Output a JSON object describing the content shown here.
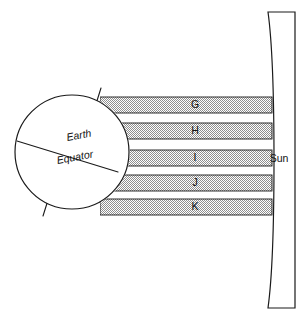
{
  "diagram": {
    "background_color": "#ffffff",
    "line_color": "#1a1a1a",
    "band_fill_color": "#9a9a9a",
    "width": 303,
    "height": 318
  },
  "earth": {
    "label": "Earth",
    "equator_label": "Equator",
    "center_x": 72,
    "center_y": 152,
    "radius": 57,
    "axis_tilt_degrees": 23.5,
    "axis_stub_top": "axis-stub-north",
    "axis_stub_bottom": "axis-stub-south"
  },
  "sun": {
    "label": "Sun",
    "label_x": 279,
    "label_y": 159,
    "left_edge_x": 268,
    "right_edge_x": 295,
    "top_y": 12,
    "bottom_y": 308,
    "edge_shape": "convex-left-limb"
  },
  "beams": {
    "count": 5,
    "band_height": 16,
    "band_pitch": 25.5,
    "left_x": 100,
    "right_x": 272,
    "bands": [
      {
        "label": "G",
        "top_y": 97,
        "center_y": 105,
        "label_x": 195
      },
      {
        "label": "H",
        "top_y": 123,
        "center_y": 131,
        "label_x": 195
      },
      {
        "label": "I",
        "top_y": 150,
        "center_y": 158,
        "label_x": 195
      },
      {
        "label": "J",
        "top_y": 175,
        "center_y": 183,
        "label_x": 195
      },
      {
        "label": "K",
        "top_y": 199,
        "center_y": 207,
        "label_x": 195
      }
    ]
  }
}
